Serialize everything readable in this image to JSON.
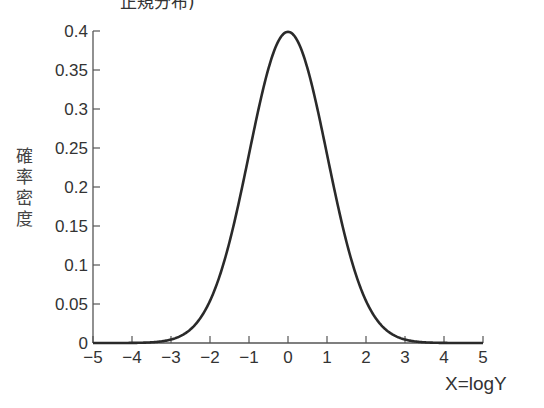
{
  "title_fragment": "正規分布)",
  "chart_data": {
    "type": "line",
    "title": "",
    "xlabel": "X=logY",
    "ylabel": "確率密度",
    "xlim": [
      -5,
      5
    ],
    "ylim": [
      0,
      0.4
    ],
    "x_ticks": [
      -5,
      -4,
      -3,
      -2,
      -1,
      0,
      1,
      2,
      3,
      4,
      5
    ],
    "x_tick_labels": [
      "−5",
      "−4",
      "−3",
      "−2",
      "−1",
      "0",
      "1",
      "2",
      "3",
      "4",
      "5"
    ],
    "y_ticks": [
      0,
      0.05,
      0.1,
      0.15,
      0.2,
      0.25,
      0.3,
      0.35,
      0.4
    ],
    "y_tick_labels": [
      "0",
      "0.05",
      "0.1",
      "0.15",
      "0.2",
      "0.25",
      "0.3",
      "0.35",
      "0.4"
    ],
    "grid": false,
    "legend": null,
    "series": [
      {
        "name": "standard normal density",
        "distribution": "normal(mean=0, sd=1)",
        "x": [
          -5,
          -4,
          -3,
          -2.5,
          -2,
          -1.5,
          -1,
          -0.5,
          0,
          0.5,
          1,
          1.5,
          2,
          2.5,
          3,
          4,
          5
        ],
        "y": [
          0.0,
          0.0001,
          0.0044,
          0.0175,
          0.054,
          0.1295,
          0.242,
          0.3521,
          0.3989,
          0.3521,
          0.242,
          0.1295,
          0.054,
          0.0175,
          0.0044,
          0.0001,
          0.0
        ]
      }
    ]
  },
  "style": {
    "line_color": "#2a2a2a",
    "axis_color": "#555555",
    "text_color": "#333333"
  }
}
